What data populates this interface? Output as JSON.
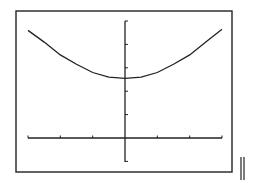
{
  "screen": {
    "frame_color": "#222222",
    "curve_color": "#222222",
    "background": "#ffffff"
  },
  "chart_data": {
    "type": "line",
    "title": "",
    "xlabel": "",
    "ylabel": "",
    "xlim": [
      -3,
      3
    ],
    "ylim": [
      -1,
      5
    ],
    "x_ticks": [
      -3,
      -2,
      -1,
      0,
      1,
      2,
      3
    ],
    "y_ticks": [
      -1,
      0,
      1,
      2,
      3,
      4,
      5
    ],
    "grid": false,
    "legend": null,
    "series": [
      {
        "name": "curve",
        "x": [
          -3,
          -2.5,
          -2,
          -1.5,
          -1,
          -0.5,
          0,
          0.5,
          1,
          1.5,
          2,
          2.5,
          3
        ],
        "y": [
          4.6,
          4.1,
          3.55,
          3.15,
          2.8,
          2.6,
          2.55,
          2.6,
          2.8,
          3.15,
          3.55,
          4.1,
          4.65
        ]
      }
    ]
  }
}
